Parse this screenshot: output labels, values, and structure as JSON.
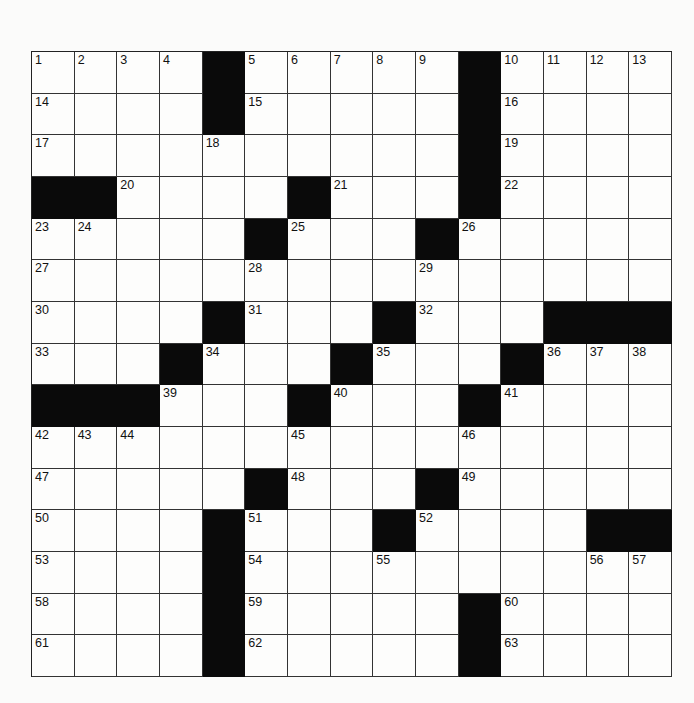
{
  "puzzle": {
    "rows": 15,
    "cols": 15,
    "blocks": [
      [
        0,
        4
      ],
      [
        0,
        10
      ],
      [
        1,
        4
      ],
      [
        1,
        10
      ],
      [
        2,
        10
      ],
      [
        3,
        0
      ],
      [
        3,
        1
      ],
      [
        3,
        6
      ],
      [
        3,
        10
      ],
      [
        4,
        5
      ],
      [
        4,
        9
      ],
      [
        6,
        4
      ],
      [
        6,
        8
      ],
      [
        6,
        12
      ],
      [
        6,
        13
      ],
      [
        6,
        14
      ],
      [
        7,
        3
      ],
      [
        7,
        7
      ],
      [
        7,
        11
      ],
      [
        8,
        0
      ],
      [
        8,
        1
      ],
      [
        8,
        2
      ],
      [
        8,
        6
      ],
      [
        8,
        10
      ],
      [
        10,
        5
      ],
      [
        10,
        9
      ],
      [
        11,
        4
      ],
      [
        11,
        8
      ],
      [
        11,
        13
      ],
      [
        11,
        14
      ],
      [
        12,
        4
      ],
      [
        13,
        4
      ],
      [
        13,
        10
      ],
      [
        14,
        4
      ],
      [
        14,
        10
      ]
    ],
    "numbers": [
      {
        "r": 0,
        "c": 0,
        "n": "1"
      },
      {
        "r": 0,
        "c": 1,
        "n": "2"
      },
      {
        "r": 0,
        "c": 2,
        "n": "3"
      },
      {
        "r": 0,
        "c": 3,
        "n": "4"
      },
      {
        "r": 0,
        "c": 5,
        "n": "5"
      },
      {
        "r": 0,
        "c": 6,
        "n": "6"
      },
      {
        "r": 0,
        "c": 7,
        "n": "7"
      },
      {
        "r": 0,
        "c": 8,
        "n": "8"
      },
      {
        "r": 0,
        "c": 9,
        "n": "9"
      },
      {
        "r": 0,
        "c": 11,
        "n": "10"
      },
      {
        "r": 0,
        "c": 12,
        "n": "11"
      },
      {
        "r": 0,
        "c": 13,
        "n": "12"
      },
      {
        "r": 0,
        "c": 14,
        "n": "13"
      },
      {
        "r": 1,
        "c": 0,
        "n": "14"
      },
      {
        "r": 1,
        "c": 5,
        "n": "15"
      },
      {
        "r": 1,
        "c": 11,
        "n": "16"
      },
      {
        "r": 2,
        "c": 0,
        "n": "17"
      },
      {
        "r": 2,
        "c": 4,
        "n": "18"
      },
      {
        "r": 2,
        "c": 11,
        "n": "19"
      },
      {
        "r": 3,
        "c": 2,
        "n": "20"
      },
      {
        "r": 3,
        "c": 7,
        "n": "21"
      },
      {
        "r": 3,
        "c": 11,
        "n": "22"
      },
      {
        "r": 4,
        "c": 0,
        "n": "23"
      },
      {
        "r": 4,
        "c": 1,
        "n": "24"
      },
      {
        "r": 4,
        "c": 6,
        "n": "25"
      },
      {
        "r": 4,
        "c": 10,
        "n": "26"
      },
      {
        "r": 5,
        "c": 0,
        "n": "27"
      },
      {
        "r": 5,
        "c": 5,
        "n": "28"
      },
      {
        "r": 5,
        "c": 9,
        "n": "29"
      },
      {
        "r": 6,
        "c": 0,
        "n": "30"
      },
      {
        "r": 6,
        "c": 5,
        "n": "31"
      },
      {
        "r": 6,
        "c": 9,
        "n": "32"
      },
      {
        "r": 7,
        "c": 0,
        "n": "33"
      },
      {
        "r": 7,
        "c": 4,
        "n": "34"
      },
      {
        "r": 7,
        "c": 8,
        "n": "35"
      },
      {
        "r": 7,
        "c": 12,
        "n": "36"
      },
      {
        "r": 7,
        "c": 13,
        "n": "37"
      },
      {
        "r": 7,
        "c": 14,
        "n": "38"
      },
      {
        "r": 8,
        "c": 3,
        "n": "39"
      },
      {
        "r": 8,
        "c": 7,
        "n": "40"
      },
      {
        "r": 8,
        "c": 11,
        "n": "41"
      },
      {
        "r": 9,
        "c": 0,
        "n": "42"
      },
      {
        "r": 9,
        "c": 1,
        "n": "43"
      },
      {
        "r": 9,
        "c": 2,
        "n": "44"
      },
      {
        "r": 9,
        "c": 6,
        "n": "45"
      },
      {
        "r": 9,
        "c": 10,
        "n": "46"
      },
      {
        "r": 10,
        "c": 0,
        "n": "47"
      },
      {
        "r": 10,
        "c": 6,
        "n": "48"
      },
      {
        "r": 10,
        "c": 10,
        "n": "49"
      },
      {
        "r": 11,
        "c": 0,
        "n": "50"
      },
      {
        "r": 11,
        "c": 5,
        "n": "51"
      },
      {
        "r": 11,
        "c": 9,
        "n": "52"
      },
      {
        "r": 12,
        "c": 0,
        "n": "53"
      },
      {
        "r": 12,
        "c": 5,
        "n": "54"
      },
      {
        "r": 12,
        "c": 8,
        "n": "55"
      },
      {
        "r": 12,
        "c": 13,
        "n": "56"
      },
      {
        "r": 12,
        "c": 14,
        "n": "57"
      },
      {
        "r": 13,
        "c": 0,
        "n": "58"
      },
      {
        "r": 13,
        "c": 5,
        "n": "59"
      },
      {
        "r": 13,
        "c": 11,
        "n": "60"
      },
      {
        "r": 14,
        "c": 0,
        "n": "61"
      },
      {
        "r": 14,
        "c": 5,
        "n": "62"
      },
      {
        "r": 14,
        "c": 11,
        "n": "63"
      }
    ],
    "letters": []
  },
  "colors": {
    "block": "#0a0a0a",
    "cell": "#fdfdfc",
    "line": "#333333",
    "background": "#fbfbfa"
  }
}
